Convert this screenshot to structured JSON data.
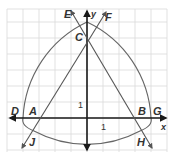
{
  "diagram": {
    "type": "coordinate-geometry",
    "colors": {
      "grid": "#d9d9d9",
      "axes": "#1a1a1a",
      "lines": "#555555",
      "arcs": "#666666",
      "labels": "#333333"
    },
    "axes": {
      "x_label": "x",
      "y_label": "y",
      "x_unit_label": "1",
      "y_unit_label": "1"
    },
    "points": [
      {
        "name": "A",
        "label": "A"
      },
      {
        "name": "B",
        "label": "B"
      },
      {
        "name": "C",
        "label": "C"
      },
      {
        "name": "D",
        "label": "D"
      },
      {
        "name": "E",
        "label": "E"
      },
      {
        "name": "F",
        "label": "F"
      },
      {
        "name": "G",
        "label": "G"
      },
      {
        "name": "H",
        "label": "H"
      },
      {
        "name": "J",
        "label": "J"
      }
    ]
  }
}
